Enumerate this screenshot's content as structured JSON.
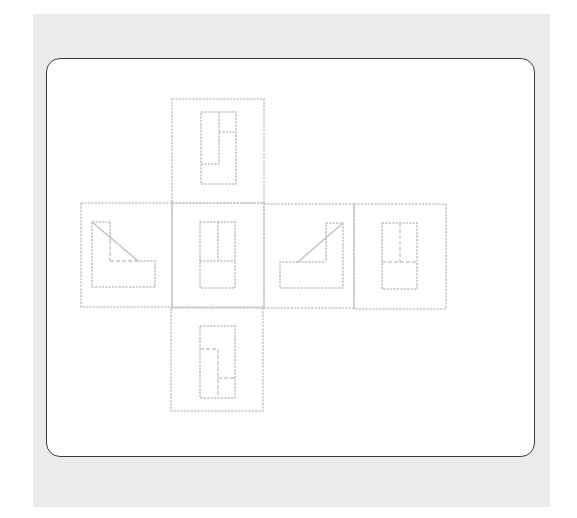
{
  "diagram": {
    "type": "orthographic-projection-net",
    "colors": {
      "background": "#ebebeb",
      "frame_border": "#3a3a3a",
      "frame_fill": "#ffffff",
      "line": "#c4c4c4"
    },
    "views": [
      {
        "id": "top",
        "position": "above-center",
        "shape": "rectangle with L-shaped internal edges"
      },
      {
        "id": "left",
        "position": "middle-row-1",
        "shape": "L-profile with diagonal slope, hidden notch lines"
      },
      {
        "id": "front",
        "position": "middle-row-2",
        "shape": "rectangle with vertical and horizontal edges"
      },
      {
        "id": "right",
        "position": "middle-row-3",
        "shape": "mirrored L-profile with diagonal slope"
      },
      {
        "id": "rear",
        "position": "middle-row-4",
        "shape": "rectangle with hidden vertical and horizontal lines"
      },
      {
        "id": "bottom",
        "position": "below-center",
        "shape": "rectangle with hidden stepped lines"
      }
    ]
  }
}
